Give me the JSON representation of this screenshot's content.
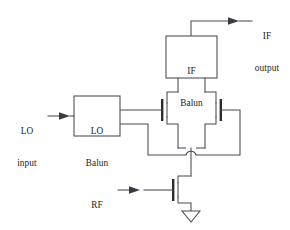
{
  "figure": {
    "type": "circuit-schematic",
    "name": "single-balanced-fet-mixer",
    "background_color": "#ffffff",
    "line_color": "#4a4a52",
    "text_color": "#1d1d22"
  },
  "blocks": {
    "if_balun": {
      "label_line1": "IF",
      "label_line2": "Balun",
      "name": "if-balun-block"
    },
    "lo_balun": {
      "label_line1": "LO",
      "label_line2": "Balun",
      "name": "lo-balun-block"
    }
  },
  "ports": {
    "lo_input": {
      "label_line1": "LO",
      "label_line2": "input",
      "direction": "in"
    },
    "rf_input": {
      "label_line1": "RF",
      "label_line2": "input",
      "direction": "in"
    },
    "if_output": {
      "label_line1": "IF",
      "label_line2": "output",
      "direction": "out"
    }
  },
  "devices": {
    "switch_fet_left": "left-switching-fet",
    "switch_fet_right": "right-switching-fet",
    "rf_fet": "rf-transconductance-fet",
    "ground": "ground-symbol"
  }
}
